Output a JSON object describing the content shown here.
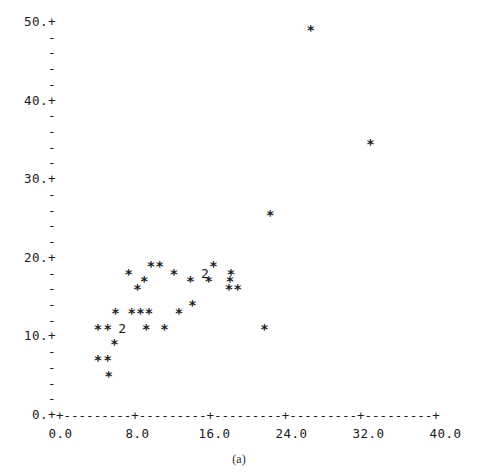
{
  "caption": "(a)",
  "chart_data": {
    "type": "scatter",
    "title": "",
    "subtitle": "",
    "xlabel": "",
    "ylabel": "",
    "xlim": [
      0.0,
      40.0
    ],
    "ylim": [
      0.0,
      50.0
    ],
    "grid": false,
    "legend": null,
    "marker": "*",
    "overlap_marker_note": "digit shows number of coincident points",
    "x_ticks": [
      {
        "value": 0.0,
        "label": "0.0"
      },
      {
        "value": 8.0,
        "label": "8.0"
      },
      {
        "value": 16.0,
        "label": "16.0"
      },
      {
        "value": 24.0,
        "label": "24.0"
      },
      {
        "value": 32.0,
        "label": "32.0"
      },
      {
        "value": 40.0,
        "label": "40.0"
      }
    ],
    "y_ticks": [
      {
        "value": 50.0,
        "label": "50.+",
        "major": true
      },
      {
        "value": 48.0,
        "label": "-",
        "major": false
      },
      {
        "value": 46.0,
        "label": "-",
        "major": false
      },
      {
        "value": 44.0,
        "label": "-",
        "major": false
      },
      {
        "value": 42.0,
        "label": "-",
        "major": false
      },
      {
        "value": 40.0,
        "label": "40.+",
        "major": true
      },
      {
        "value": 38.0,
        "label": "-",
        "major": false
      },
      {
        "value": 36.0,
        "label": "-",
        "major": false
      },
      {
        "value": 34.0,
        "label": "-",
        "major": false
      },
      {
        "value": 32.0,
        "label": "-",
        "major": false
      },
      {
        "value": 30.0,
        "label": "30.+",
        "major": true
      },
      {
        "value": 28.0,
        "label": "-",
        "major": false
      },
      {
        "value": 26.0,
        "label": "-",
        "major": false
      },
      {
        "value": 24.0,
        "label": "-",
        "major": false
      },
      {
        "value": 22.0,
        "label": "-",
        "major": false
      },
      {
        "value": 20.0,
        "label": "20.+",
        "major": true
      },
      {
        "value": 18.0,
        "label": "-",
        "major": false
      },
      {
        "value": 16.0,
        "label": "-",
        "major": false
      },
      {
        "value": 14.0,
        "label": "-",
        "major": false
      },
      {
        "value": 12.0,
        "label": "-",
        "major": false
      },
      {
        "value": 10.0,
        "label": "10.+",
        "major": true
      },
      {
        "value": 8.0,
        "label": "-",
        "major": false
      },
      {
        "value": 6.0,
        "label": "-",
        "major": false
      },
      {
        "value": 4.0,
        "label": "-",
        "major": false
      },
      {
        "value": 2.0,
        "label": "-",
        "major": false
      },
      {
        "value": 0.0,
        "label": "0.+",
        "major": true
      }
    ],
    "x_axis_line": "+---------+---------+---------+---------+---------+",
    "points": [
      {
        "x": 26.0,
        "y": 49.0,
        "n": 1,
        "glyph": "*"
      },
      {
        "x": 32.2,
        "y": 34.5,
        "n": 1,
        "glyph": "*"
      },
      {
        "x": 21.8,
        "y": 25.5,
        "n": 1,
        "glyph": "*"
      },
      {
        "x": 9.4,
        "y": 19.0,
        "n": 1,
        "glyph": "*"
      },
      {
        "x": 10.3,
        "y": 19.0,
        "n": 1,
        "glyph": "*"
      },
      {
        "x": 15.9,
        "y": 19.0,
        "n": 1,
        "glyph": "*"
      },
      {
        "x": 7.1,
        "y": 18.0,
        "n": 1,
        "glyph": "*"
      },
      {
        "x": 11.8,
        "y": 18.0,
        "n": 1,
        "glyph": "*"
      },
      {
        "x": 15.0,
        "y": 18.0,
        "n": 2,
        "glyph": "2"
      },
      {
        "x": 17.7,
        "y": 18.0,
        "n": 1,
        "glyph": "*"
      },
      {
        "x": 8.7,
        "y": 17.0,
        "n": 1,
        "glyph": "*"
      },
      {
        "x": 13.5,
        "y": 17.0,
        "n": 1,
        "glyph": "*"
      },
      {
        "x": 15.4,
        "y": 17.0,
        "n": 1,
        "glyph": "*"
      },
      {
        "x": 17.6,
        "y": 17.0,
        "n": 1,
        "glyph": "*"
      },
      {
        "x": 8.0,
        "y": 16.0,
        "n": 1,
        "glyph": "*"
      },
      {
        "x": 17.5,
        "y": 16.0,
        "n": 1,
        "glyph": "*"
      },
      {
        "x": 18.4,
        "y": 16.0,
        "n": 1,
        "glyph": "*"
      },
      {
        "x": 13.7,
        "y": 14.0,
        "n": 1,
        "glyph": "*"
      },
      {
        "x": 5.7,
        "y": 13.0,
        "n": 1,
        "glyph": "*"
      },
      {
        "x": 7.4,
        "y": 13.0,
        "n": 1,
        "glyph": "*"
      },
      {
        "x": 8.3,
        "y": 13.0,
        "n": 1,
        "glyph": "*"
      },
      {
        "x": 9.2,
        "y": 13.0,
        "n": 1,
        "glyph": "*"
      },
      {
        "x": 12.3,
        "y": 13.0,
        "n": 1,
        "glyph": "*"
      },
      {
        "x": 3.9,
        "y": 11.0,
        "n": 1,
        "glyph": "*"
      },
      {
        "x": 4.9,
        "y": 11.0,
        "n": 1,
        "glyph": "*"
      },
      {
        "x": 6.4,
        "y": 11.0,
        "n": 2,
        "glyph": "2"
      },
      {
        "x": 8.9,
        "y": 11.0,
        "n": 1,
        "glyph": "*"
      },
      {
        "x": 10.8,
        "y": 11.0,
        "n": 1,
        "glyph": "*"
      },
      {
        "x": 21.2,
        "y": 11.0,
        "n": 1,
        "glyph": "*"
      },
      {
        "x": 5.6,
        "y": 9.0,
        "n": 1,
        "glyph": "*"
      },
      {
        "x": 3.9,
        "y": 7.0,
        "n": 1,
        "glyph": "*"
      },
      {
        "x": 4.9,
        "y": 7.0,
        "n": 1,
        "glyph": "*"
      },
      {
        "x": 5.0,
        "y": 5.0,
        "n": 1,
        "glyph": "*"
      }
    ]
  }
}
